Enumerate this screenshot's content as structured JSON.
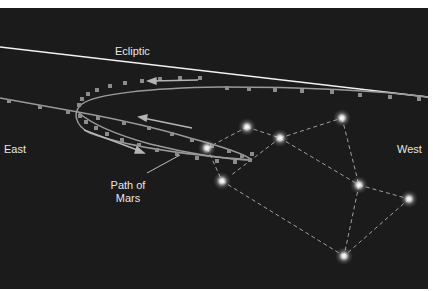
{
  "diagram": {
    "labels": {
      "ecliptic": "Ecliptic",
      "east": "East",
      "west": "West",
      "path_line1": "Path of",
      "path_line2": "Mars"
    },
    "colors": {
      "background": "#1b1b1b",
      "ecliptic": "#f2f2f2",
      "path": "#9a9a9a",
      "path_dot": "#8c8c8c",
      "arrow": "#b5b5b5",
      "constellation_line": "#a0a0a0",
      "star": "#ffffff",
      "text": "#e6e6e6"
    },
    "stars": [
      {
        "x": 247,
        "y": 119
      },
      {
        "x": 280,
        "y": 130
      },
      {
        "x": 207,
        "y": 140
      },
      {
        "x": 222,
        "y": 173
      },
      {
        "x": 342,
        "y": 110
      },
      {
        "x": 359,
        "y": 177
      },
      {
        "x": 409,
        "y": 191
      },
      {
        "x": 344,
        "y": 248
      }
    ]
  }
}
